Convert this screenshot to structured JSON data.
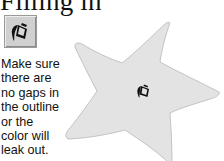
{
  "heading": "Filling in",
  "tool": {
    "name": "Fill",
    "icon": "paint-bucket-icon"
  },
  "note": {
    "lines": [
      "Make sure",
      "there are",
      "no gaps in",
      "the outline",
      "or the",
      "color will",
      "leak out."
    ]
  },
  "illustration": {
    "shape": "star",
    "fill_color": "#e3e3e3",
    "outline_color": "#b8b8b8",
    "cursor_icon": "paint-bucket-cursor-icon"
  }
}
